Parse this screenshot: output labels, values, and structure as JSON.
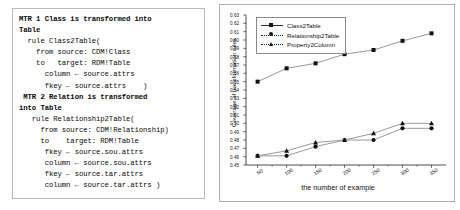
{
  "figure": {
    "left_panel": {
      "name": "transformation-rule-code",
      "lines": [
        {
          "text": "MTR 1 Class is transformed into",
          "bold": true
        },
        {
          "text": "Table",
          "bold": true
        },
        {
          "text": "  rule Class2Table(",
          "bold": false
        },
        {
          "text": "    from source: CDM!Class",
          "bold": false
        },
        {
          "text": "    to   target: RDM!Table",
          "bold": false
        },
        {
          "text": "      column ← source.attrs",
          "bold": false
        },
        {
          "text": "      fkey ← source.attrs    )",
          "bold": false
        },
        {
          "text": " MTR 2 Relation is transformed",
          "bold": true
        },
        {
          "text": "into Table",
          "bold": true
        },
        {
          "text": "   rule Relationship2Table(",
          "bold": false
        },
        {
          "text": "     from source: CDM!Relationship)",
          "bold": false
        },
        {
          "text": "     to    target: RDM!Table",
          "bold": false
        },
        {
          "text": "      fkey ← source.sou.attrs",
          "bold": false
        },
        {
          "text": "      column ← source.sou.attrs",
          "bold": false
        },
        {
          "text": "      fkey ← source.tar.attrs",
          "bold": false
        },
        {
          "text": "      column ← source.tar.attrs )",
          "bold": false
        }
      ]
    }
  },
  "chart_data": {
    "type": "line",
    "title": "",
    "xlabel": "the number of example",
    "ylabel": "Coverage of transformation rules",
    "x": [
      50,
      100,
      150,
      200,
      250,
      300,
      350
    ],
    "xticklabels": [
      "50",
      "100",
      "150",
      "200",
      "250",
      "300",
      "350"
    ],
    "xlim": [
      30,
      375
    ],
    "ylim": [
      0.45,
      0.63
    ],
    "yticks": [
      0.45,
      0.46,
      0.47,
      0.48,
      0.49,
      0.5,
      0.51,
      0.52,
      0.53,
      0.54,
      0.55,
      0.56,
      0.57,
      0.58,
      0.59,
      0.6,
      0.61,
      0.62,
      0.63
    ],
    "yticklabels": [
      "0.45",
      "0.46",
      "0.47",
      "0.48",
      "0.49",
      "0.50",
      "0.51",
      "0.52",
      "0.53",
      "0.54",
      "0.55",
      "0.56",
      "0.57",
      "0.58",
      "0.59",
      "0.60",
      "0.61",
      "0.62",
      "0.63"
    ],
    "grid": false,
    "legend_position": "upper left",
    "line_color": "#8c8c8c",
    "marker_color": "#111111",
    "series": [
      {
        "name": "Class2Table",
        "marker": "square",
        "values": [
          0.55,
          0.566,
          0.572,
          0.583,
          0.588,
          0.599,
          0.608
        ]
      },
      {
        "name": "Relationship2Table",
        "marker": "circle",
        "values": [
          0.461,
          0.461,
          0.472,
          0.48,
          0.48,
          0.494,
          0.494
        ]
      },
      {
        "name": "Property2Column",
        "marker": "triangle",
        "values": [
          0.461,
          0.467,
          0.477,
          0.48,
          0.488,
          0.5,
          0.5
        ]
      }
    ]
  }
}
